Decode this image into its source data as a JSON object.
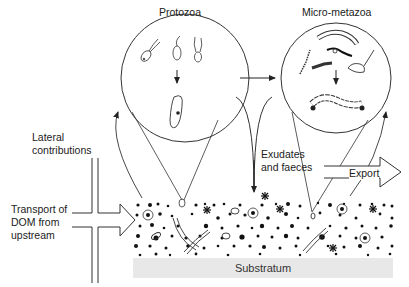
{
  "diagram": {
    "labels": {
      "protozoa": "Protozoa",
      "micro_metazoa": "Micro-metazoa",
      "lateral_contributions_line1": "Lateral",
      "lateral_contributions_line2": "contributions",
      "transport_line1": "Transport of",
      "transport_line2": "DOM from",
      "transport_line3": "upstream",
      "exudates_line1": "Exudates",
      "exudates_line2": "and faeces",
      "export": "Export",
      "substratum": "Substratum"
    },
    "nodes": [
      {
        "id": "protozoa",
        "shape": "circle",
        "content": "flagellates and ciliate"
      },
      {
        "id": "micro-metazoa",
        "shape": "circle",
        "content": "rotifers, nematodes, oligochaetes"
      },
      {
        "id": "biofilm",
        "shape": "dotted band",
        "content": "particles, bacteria, algae"
      },
      {
        "id": "substratum",
        "shape": "rectangle"
      }
    ],
    "edges": [
      {
        "from": "protozoa",
        "to": "micro-metazoa",
        "type": "arrow"
      },
      {
        "from": "biofilm",
        "to": "protozoa",
        "type": "arrow"
      },
      {
        "from": "biofilm",
        "to": "micro-metazoa",
        "type": "arrow"
      },
      {
        "from": "protozoa",
        "to": "biofilm",
        "label": "Exudates and faeces",
        "type": "arrow"
      },
      {
        "from": "micro-metazoa",
        "to": "biofilm",
        "label": "Exudates and faeces",
        "type": "arrow"
      },
      {
        "from": "upstream",
        "to": "biofilm",
        "label": "Transport of DOM from upstream",
        "type": "block-arrow"
      },
      {
        "from": "biofilm",
        "to": "downstream",
        "label": "Export",
        "type": "block-arrow"
      }
    ]
  }
}
